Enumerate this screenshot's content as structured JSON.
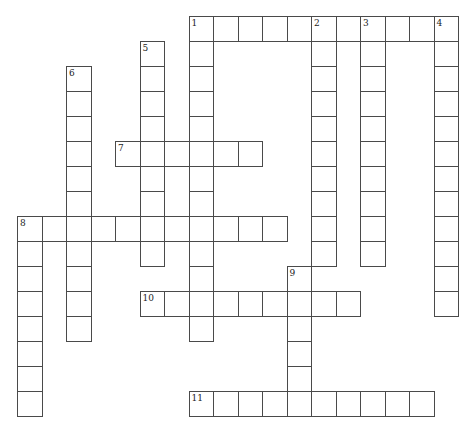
{
  "puzzle": {
    "grid": {
      "origin_x": 17,
      "origin_y": 16,
      "cell_w": 24.5,
      "cell_h": 25
    },
    "entries": [
      {
        "number": "1",
        "direction": "across",
        "row": 0,
        "col": 0,
        "length": 11,
        "start_col": 7
      },
      {
        "number": "1",
        "direction": "down",
        "row": 0,
        "col": 7,
        "length": 13
      },
      {
        "number": "2",
        "direction": "down",
        "row": 0,
        "col": 12,
        "length": 10
      },
      {
        "number": "3",
        "direction": "down",
        "row": 0,
        "col": 14,
        "length": 10
      },
      {
        "number": "4",
        "direction": "down",
        "row": 0,
        "col": 17,
        "length": 12
      },
      {
        "number": "5",
        "direction": "down",
        "row": 1,
        "col": 5,
        "length": 9
      },
      {
        "number": "6",
        "direction": "down",
        "row": 2,
        "col": 2,
        "length": 11
      },
      {
        "number": "7",
        "direction": "across",
        "row": 5,
        "col": 4,
        "length": 6
      },
      {
        "number": "8",
        "direction": "across",
        "row": 8,
        "col": 0,
        "length": 11
      },
      {
        "number": "8",
        "direction": "down",
        "row": 8,
        "col": 0,
        "length": 8
      },
      {
        "number": "9",
        "direction": "down",
        "row": 10,
        "col": 11,
        "length": 6
      },
      {
        "number": "10",
        "direction": "across",
        "row": 11,
        "col": 5,
        "length": 9
      },
      {
        "number": "11",
        "direction": "across",
        "row": 15,
        "col": 7,
        "length": 10
      }
    ]
  }
}
